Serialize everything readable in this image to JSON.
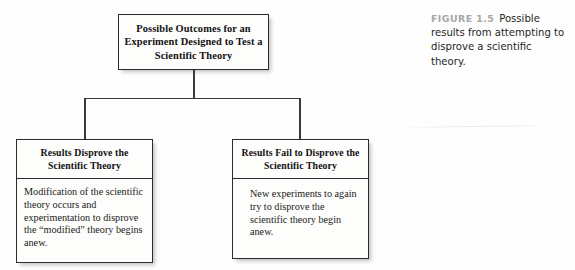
{
  "figure": {
    "root": {
      "title": "Possible Outcomes for an Experiment Designed to Test a Scientific Theory"
    },
    "branches": [
      {
        "heading": "Results Disprove the Scientific Theory",
        "body": "Modification of the scientific theory occurs and experimentation to disprove the “modified” theory begins anew."
      },
      {
        "heading": "Results Fail to Disprove the Scientific Theory",
        "body": "New experiments to again try to disprove the scientific theory begin anew."
      }
    ]
  },
  "caption": {
    "label": "FIGURE 1.5",
    "text": "Possible results from attempting to disprove a scientific theory.",
    "label_color": "#a6a6a6",
    "text_color": "#262626"
  },
  "colors": {
    "page_background": "#fefefe",
    "box_fill": "#fdfdfc",
    "box_border": "#2b2b2b",
    "connector": "#3a3a3a",
    "text": "#111111"
  }
}
